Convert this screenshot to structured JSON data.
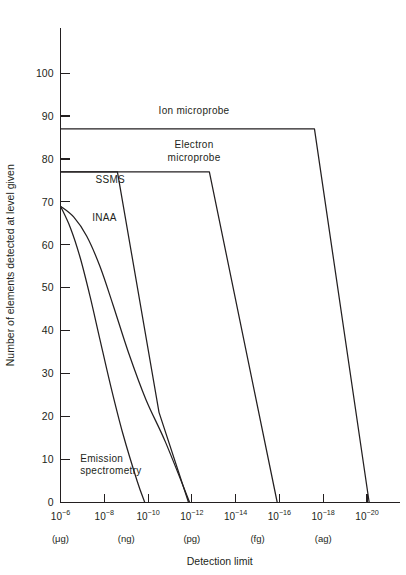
{
  "chart_data": {
    "type": "line",
    "title": "",
    "xlabel": "Detection limit",
    "ylabel": "Number of elements detected at level given",
    "xscale": "log",
    "xlim": [
      -6,
      -21
    ],
    "ylim": [
      0,
      105
    ],
    "grid": false,
    "legend_position": "inline-annotations",
    "x_tick_labels": [
      "10−6",
      "10−8",
      "10−10",
      "10−12",
      "10−14",
      "10−16",
      "10−18",
      "10−20"
    ],
    "x_tick_exponents": [
      -6,
      -8,
      -10,
      -12,
      -14,
      -16,
      -18,
      -20
    ],
    "x_tick_mantissa": "10",
    "x_unit_labels": [
      {
        "text": "(μg)",
        "exponent": -6
      },
      {
        "text": "(ng)",
        "exponent": -9
      },
      {
        "text": "(pg)",
        "exponent": -12
      },
      {
        "text": "(fg)",
        "exponent": -15
      },
      {
        "text": "(ag)",
        "exponent": -18
      }
    ],
    "y_tick_labels": [
      "0",
      "10",
      "20",
      "30",
      "40",
      "50",
      "60",
      "70",
      "80",
      "90",
      "100"
    ],
    "y_tick_values": [
      0,
      10,
      20,
      30,
      40,
      50,
      60,
      70,
      80,
      90,
      100
    ],
    "line_color": "#231f20",
    "series": [
      {
        "name": "Ion microprobe",
        "label": "Ion microprobe",
        "label_at": {
          "exponent": -12.1,
          "value": 90.5
        },
        "points": [
          {
            "x": -6,
            "y": 87
          },
          {
            "x": -17.6,
            "y": 87
          },
          {
            "x": -20.1,
            "y": 0
          }
        ]
      },
      {
        "name": "Electron microprobe",
        "label": "Electron\nmicroprobe",
        "label_line1": "Electron",
        "label_line2": "microprobe",
        "label_at": {
          "exponent": -12.1,
          "value": 82.5
        },
        "points": [
          {
            "x": -6,
            "y": 77
          },
          {
            "x": -12.8,
            "y": 77
          },
          {
            "x": -15.9,
            "y": 0
          }
        ]
      },
      {
        "name": "SSMS",
        "label": "SSMS",
        "label_at": {
          "exponent": -7.6,
          "value": 74.5
        },
        "points": [
          {
            "x": -6,
            "y": 77
          },
          {
            "x": -8.6,
            "y": 77
          },
          {
            "x": -10.5,
            "y": 21
          },
          {
            "x": -11.85,
            "y": 0
          }
        ]
      },
      {
        "name": "INAA",
        "label": "INAA",
        "label_at": {
          "exponent": -7.45,
          "value": 65.5
        },
        "points": [
          {
            "x": -6,
            "y": 69
          },
          {
            "x": -6.6,
            "y": 66.5
          },
          {
            "x": -7.2,
            "y": 62
          },
          {
            "x": -7.8,
            "y": 55
          },
          {
            "x": -8.4,
            "y": 46
          },
          {
            "x": -9.1,
            "y": 35
          },
          {
            "x": -9.9,
            "y": 24
          },
          {
            "x": -10.8,
            "y": 14
          },
          {
            "x": -11.9,
            "y": 0
          }
        ]
      },
      {
        "name": "Emission spectrometry",
        "label": "Emission\nspectrometry",
        "label_line1": "Emission",
        "label_line2": "spectrometry",
        "label_at": {
          "exponent": -6.9,
          "value": 9.5
        },
        "points": [
          {
            "x": -6,
            "y": 69
          },
          {
            "x": -6.45,
            "y": 64
          },
          {
            "x": -6.9,
            "y": 57
          },
          {
            "x": -7.35,
            "y": 48
          },
          {
            "x": -7.8,
            "y": 38
          },
          {
            "x": -8.3,
            "y": 27
          },
          {
            "x": -8.85,
            "y": 16
          },
          {
            "x": -9.5,
            "y": 5
          },
          {
            "x": -9.85,
            "y": 0
          }
        ]
      }
    ]
  },
  "figure": {
    "background_color": "#ffffff",
    "ink_color": "#231f20"
  }
}
